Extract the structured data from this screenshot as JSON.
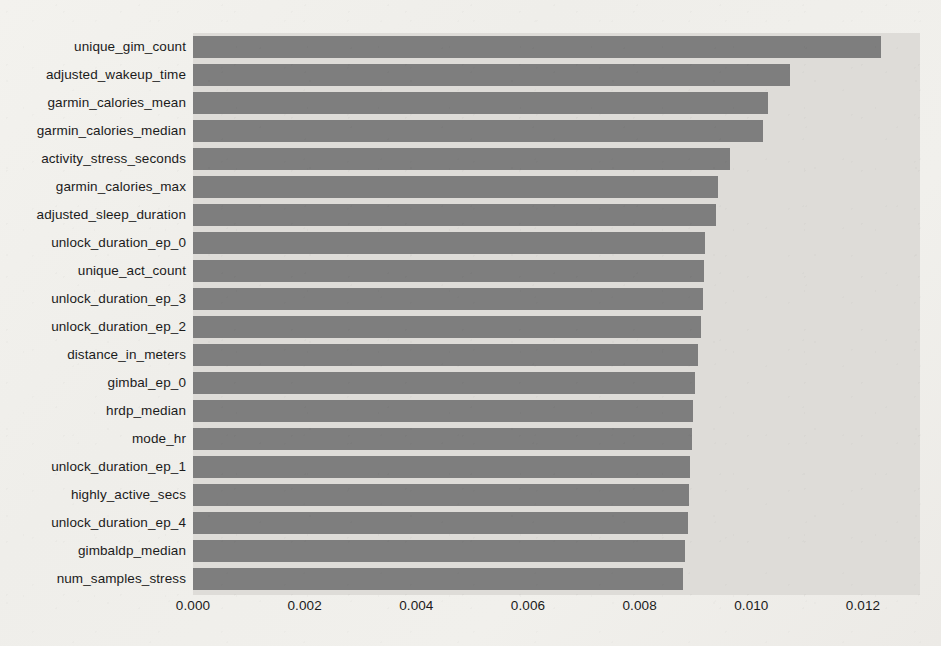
{
  "chart_data": {
    "type": "bar",
    "orientation": "horizontal",
    "title": "",
    "xlabel": "",
    "ylabel": "",
    "xlim": [
      0.0,
      0.013021
    ],
    "xticks": [
      0.0,
      0.002,
      0.004,
      0.006,
      0.008,
      0.01,
      0.012
    ],
    "xtick_labels": [
      "0.000",
      "0.002",
      "0.004",
      "0.006",
      "0.008",
      "0.010",
      "0.012"
    ],
    "grid": false,
    "legend": null,
    "bar_color": "#7e7e7e",
    "plot_background": "#dedcd8",
    "figure_background": "#f1f0ec",
    "categories": [
      "unique_gim_count",
      "adjusted_wakeup_time",
      "garmin_calories_mean",
      "garmin_calories_median",
      "activity_stress_seconds",
      "garmin_calories_max",
      "adjusted_sleep_duration",
      "unlock_duration_ep_0",
      "unique_act_count",
      "unlock_duration_ep_3",
      "unlock_duration_ep_2",
      "distance_in_meters",
      "gimbal_ep_0",
      "hrdp_median",
      "mode_hr",
      "unlock_duration_ep_1",
      "highly_active_secs",
      "unlock_duration_ep_4",
      "gimbaldp_median",
      "num_samples_stress"
    ],
    "values": [
      0.01232,
      0.01069,
      0.0103,
      0.01021,
      0.00962,
      0.0094,
      0.00937,
      0.00917,
      0.00915,
      0.00913,
      0.0091,
      0.00904,
      0.00899,
      0.00896,
      0.00894,
      0.0089,
      0.00888,
      0.00887,
      0.00881,
      0.00878
    ]
  }
}
